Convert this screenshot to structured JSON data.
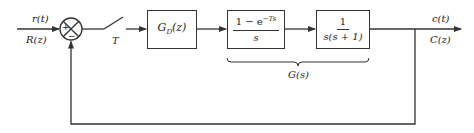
{
  "diagram": {
    "type": "block-diagram",
    "input": {
      "time_label": "r(t)",
      "z_label": "R(z)"
    },
    "summing_junction": {
      "plus_sign": "+",
      "minus_sign": "−"
    },
    "sampler": {
      "label": "T"
    },
    "blocks": [
      {
        "id": "controller",
        "base": "G",
        "sub": "D",
        "arg": "(z)"
      },
      {
        "id": "zoh",
        "numerator": "1 − e",
        "numerator_exp": "−Ts",
        "denominator": "s"
      },
      {
        "id": "plant",
        "numerator": "1",
        "denominator": "s(s + 1)"
      }
    ],
    "brace_label": "G(s)",
    "output": {
      "time_label": "c(t)",
      "z_label": "C(z)"
    },
    "colors": {
      "line": "#333333",
      "text": "#222222",
      "background": "#ffffff"
    }
  }
}
